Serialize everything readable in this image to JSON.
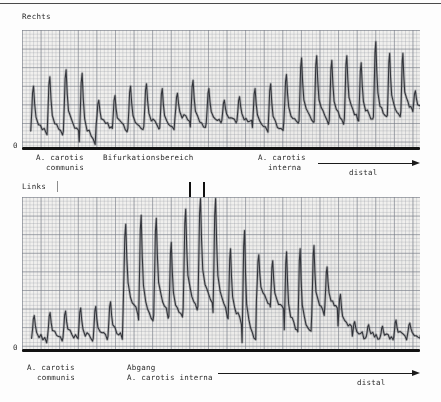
{
  "document": {
    "type": "carotid-doppler-velocity-tracing",
    "modality": "CW-Doppler",
    "language": "de"
  },
  "panels": [
    {
      "id": "rechts",
      "side_label": "Rechts",
      "zero_label": "0",
      "annotations": [
        {
          "name": "a-carotis-communis",
          "line1": "A. carotis",
          "line2": "communis"
        },
        {
          "name": "bifurkationsbereich",
          "line1": "Bifurkationsbereich",
          "line2": ""
        },
        {
          "name": "a-carotis-interna",
          "line1": "A. carotis",
          "line2": "interna"
        },
        {
          "name": "distal",
          "line1": "",
          "line2": "distal"
        }
      ]
    },
    {
      "id": "links",
      "side_label": "Links",
      "zero_label": "0",
      "annotations": [
        {
          "name": "a-carotis-communis",
          "line1": "A. carotis",
          "line2": "communis"
        },
        {
          "name": "abgang-a-carotis-interna",
          "line1": "Abgang",
          "line2": "A. carotis interna"
        },
        {
          "name": "distal",
          "line1": "",
          "line2": "distal"
        }
      ]
    }
  ],
  "chart_data": [
    {
      "id": "rechts",
      "type": "line",
      "title": "Rechts",
      "xlabel": "",
      "ylabel": "",
      "ylim": [
        0,
        100
      ],
      "grid": true,
      "legend": "none",
      "baseline_value": 0,
      "segments": [
        {
          "label": "A. carotis communis",
          "x_start": 0,
          "x_end": 20
        },
        {
          "label": "Bifurkationsbereich",
          "x_start": 20,
          "x_end": 59
        },
        {
          "label": "A. carotis interna",
          "x_start": 59,
          "x_end": 100
        }
      ],
      "beats": [
        {
          "x": 2.2,
          "peak": 52,
          "trough": 12
        },
        {
          "x": 6.3,
          "peak": 60,
          "trough": 10
        },
        {
          "x": 10.4,
          "peak": 66,
          "trough": 13
        },
        {
          "x": 14.4,
          "peak": 63,
          "trough": 4
        },
        {
          "x": 18.6,
          "peak": 40,
          "trough": 16
        },
        {
          "x": 22.7,
          "peak": 44,
          "trough": 15
        },
        {
          "x": 26.6,
          "peak": 52,
          "trough": 14
        },
        {
          "x": 30.6,
          "peak": 54,
          "trough": 16
        },
        {
          "x": 34.6,
          "peak": 50,
          "trough": 15
        },
        {
          "x": 38.4,
          "peak": 46,
          "trough": 22
        },
        {
          "x": 42.3,
          "peak": 57,
          "trough": 17
        },
        {
          "x": 46.3,
          "peak": 50,
          "trough": 20
        },
        {
          "x": 50.2,
          "peak": 40,
          "trough": 22
        },
        {
          "x": 54.0,
          "peak": 43,
          "trough": 21
        },
        {
          "x": 57.9,
          "peak": 50,
          "trough": 16
        },
        {
          "x": 61.8,
          "peak": 54,
          "trough": 12
        },
        {
          "x": 65.8,
          "peak": 62,
          "trough": 20
        },
        {
          "x": 69.6,
          "peak": 76,
          "trough": 22
        },
        {
          "x": 73.4,
          "peak": 78,
          "trough": 21
        },
        {
          "x": 77.2,
          "peak": 74,
          "trough": 21
        },
        {
          "x": 81.0,
          "peak": 78,
          "trough": 24
        },
        {
          "x": 84.6,
          "peak": 72,
          "trough": 22
        },
        {
          "x": 88.3,
          "peak": 90,
          "trough": 24
        },
        {
          "x": 91.8,
          "peak": 80,
          "trough": 26
        },
        {
          "x": 95.2,
          "peak": 80,
          "trough": 30
        },
        {
          "x": 98.2,
          "peak": 48,
          "trough": 30
        }
      ]
    },
    {
      "id": "links",
      "type": "line",
      "title": "Links",
      "xlabel": "",
      "ylabel": "",
      "ylim": [
        0,
        100
      ],
      "grid": true,
      "legend": "none",
      "baseline_value": 0,
      "segments": [
        {
          "label": "A. carotis communis",
          "x_start": 0,
          "x_end": 24
        },
        {
          "label": "Abgang A. carotis interna",
          "x_start": 24,
          "x_end": 72
        },
        {
          "label": "distal",
          "x_start": 72,
          "x_end": 100
        }
      ],
      "beats": [
        {
          "x": 2.4,
          "peak": 22,
          "trough": 5
        },
        {
          "x": 6.4,
          "peak": 24,
          "trough": 6
        },
        {
          "x": 10.3,
          "peak": 25,
          "trough": 7
        },
        {
          "x": 14.1,
          "peak": 27,
          "trough": 6
        },
        {
          "x": 17.9,
          "peak": 28,
          "trough": 7
        },
        {
          "x": 21.6,
          "peak": 31,
          "trough": 8
        },
        {
          "x": 25.4,
          "peak": 82,
          "trough": 24
        },
        {
          "x": 29.3,
          "peak": 88,
          "trough": 18
        },
        {
          "x": 33.1,
          "peak": 86,
          "trough": 22
        },
        {
          "x": 36.9,
          "peak": 70,
          "trough": 20
        },
        {
          "x": 40.5,
          "peak": 92,
          "trough": 26
        },
        {
          "x": 44.2,
          "peak": 99,
          "trough": 28
        },
        {
          "x": 48.0,
          "peak": 99,
          "trough": 22
        },
        {
          "x": 51.8,
          "peak": 66,
          "trough": 18
        },
        {
          "x": 55.3,
          "peak": 78,
          "trough": 4
        },
        {
          "x": 58.9,
          "peak": 62,
          "trough": 30
        },
        {
          "x": 62.4,
          "peak": 58,
          "trough": 26
        },
        {
          "x": 65.9,
          "peak": 64,
          "trough": 12
        },
        {
          "x": 69.3,
          "peak": 66,
          "trough": 10
        },
        {
          "x": 72.8,
          "peak": 68,
          "trough": 22
        },
        {
          "x": 76.1,
          "peak": 54,
          "trough": 28
        },
        {
          "x": 79.4,
          "peak": 36,
          "trough": 14
        },
        {
          "x": 83.0,
          "peak": 18,
          "trough": 8
        },
        {
          "x": 86.5,
          "peak": 16,
          "trough": 7
        },
        {
          "x": 90.0,
          "peak": 15,
          "trough": 6
        },
        {
          "x": 93.4,
          "peak": 19,
          "trough": 7
        },
        {
          "x": 96.8,
          "peak": 17,
          "trough": 8
        }
      ],
      "clipped_peaks": [
        {
          "x": 44.2,
          "note": "overshoot above display range"
        },
        {
          "x": 48.0,
          "note": "overshoot above display range"
        }
      ]
    }
  ]
}
